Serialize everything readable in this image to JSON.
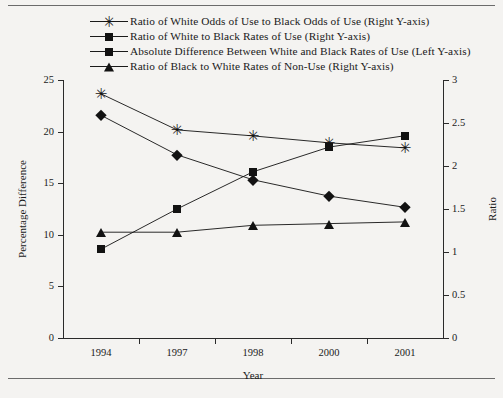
{
  "chart_data": {
    "type": "line",
    "title": "",
    "xlabel": "Year",
    "ylabel": "Percentage Difference",
    "y2label": "Ratio",
    "categories": [
      "1994",
      "1997",
      "1998",
      "2000",
      "2001"
    ],
    "ylim": [
      0,
      25
    ],
    "y2lim": [
      0,
      3
    ],
    "yticks": [
      "0",
      "5",
      "10",
      "15",
      "20",
      "25"
    ],
    "y2ticks": [
      "0",
      "0.5",
      "1",
      "1.5",
      "2",
      "2.5",
      "3"
    ],
    "grid": false,
    "legend_position": "top",
    "series": [
      {
        "name": "Ratio of White Odds of Use to Black Odds of Use (Right Y-axis)",
        "marker": "star",
        "axis": "right",
        "values": [
          2.84,
          2.42,
          2.35,
          2.27,
          2.21
        ]
      },
      {
        "name": "Ratio of White to Black Rates of Use (Right Y-axis)",
        "marker": "diamond",
        "axis": "right",
        "values": [
          2.59,
          2.13,
          1.84,
          1.65,
          1.52
        ]
      },
      {
        "name": "Absolute Difference Between White and Black Rates of Use (Left Y-axis)",
        "marker": "square",
        "axis": "left",
        "values": [
          8.6,
          12.5,
          16.1,
          18.5,
          19.6
        ]
      },
      {
        "name": "Ratio of Black to White Rates of Non-Use (Right Y-axis)",
        "marker": "triangle",
        "axis": "right",
        "values": [
          1.23,
          1.23,
          1.31,
          1.33,
          1.35
        ]
      }
    ]
  },
  "colors": {
    "ink": "#121212",
    "axis": "#2a2a2a",
    "background": "#f4f3f1",
    "rule": "#6b6b6b"
  }
}
